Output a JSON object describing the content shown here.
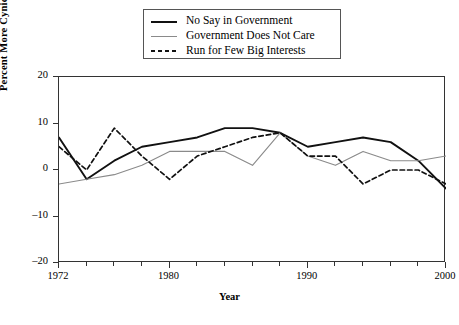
{
  "chart_data": {
    "type": "line",
    "title": "",
    "xlabel": "Year",
    "ylabel": "Percent More Cynical",
    "xlim": [
      1972,
      2000
    ],
    "ylim": [
      -20,
      20
    ],
    "yticks": [
      20,
      10,
      0,
      -10,
      -20
    ],
    "ytick_labels": [
      "20",
      "10",
      "0",
      "–10",
      "–20"
    ],
    "xticks": [
      1972,
      1980,
      1990,
      2000
    ],
    "xtick_labels": [
      "1972",
      "1980",
      "1990",
      "2000"
    ],
    "xminor_step": 2,
    "grid": false,
    "legend_position": "top-center",
    "series": [
      {
        "name": "No Say in Government",
        "style": "solid",
        "color": "#111111",
        "width": 1.9,
        "x": [
          1972,
          1974,
          1976,
          1978,
          1980,
          1982,
          1984,
          1986,
          1988,
          1990,
          1992,
          1994,
          1996,
          1998,
          2000
        ],
        "values": [
          7,
          -2,
          2,
          5,
          6,
          7,
          9,
          9,
          8,
          5,
          6,
          7,
          6,
          2,
          -4
        ]
      },
      {
        "name": "Government Does Not Care",
        "style": "solid",
        "color": "#8a8a8a",
        "width": 1.1,
        "x": [
          1972,
          1974,
          1976,
          1978,
          1980,
          1982,
          1984,
          1986,
          1988,
          1990,
          1992,
          1994,
          1996,
          1998,
          2000
        ],
        "values": [
          -3,
          -2,
          -1,
          1,
          4,
          4,
          4,
          1,
          8,
          3,
          1,
          4,
          2,
          2,
          3
        ]
      },
      {
        "name": "Run for Few Big Interests",
        "style": "dashed",
        "color": "#111111",
        "width": 1.7,
        "x": [
          1972,
          1974,
          1976,
          1978,
          1980,
          1982,
          1984,
          1986,
          1988,
          1990,
          1992,
          1994,
          1996,
          1998,
          2000
        ],
        "values": [
          5,
          0,
          9,
          3,
          -2,
          3,
          5,
          7,
          8,
          3,
          3,
          -3,
          0,
          0,
          -3
        ]
      }
    ]
  },
  "legend": {
    "items": [
      {
        "label": "No Say in Government",
        "sample": "solid-black-line"
      },
      {
        "label": "Government Does Not Care",
        "sample": "solid-gray-line"
      },
      {
        "label": "Run for Few Big Interests",
        "sample": "dashed-black-line"
      }
    ]
  }
}
